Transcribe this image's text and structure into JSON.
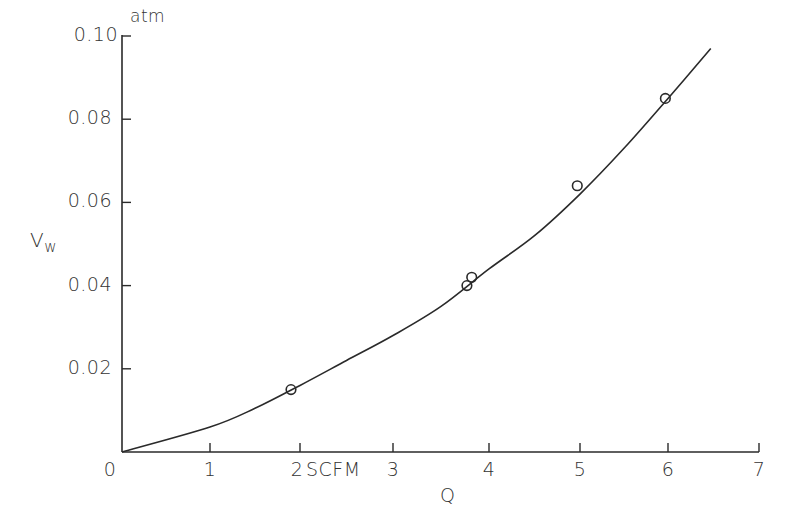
{
  "chart_data": {
    "type": "scatter",
    "title": "",
    "xlabel": "Q",
    "x_unit": "SCFM",
    "ylabel": "Vw",
    "y_unit": "atm",
    "xlim": [
      0,
      7
    ],
    "ylim": [
      0,
      0.1
    ],
    "grid": false,
    "x_ticks": [
      "0",
      "1",
      "2",
      "3",
      "4",
      "5",
      "6",
      "7"
    ],
    "y_ticks": [
      "0.02",
      "0.04",
      "0.06",
      "0.08",
      "0.10"
    ],
    "series": [
      {
        "name": "measured",
        "marker": "open-circle",
        "points": [
          {
            "x": 1.9,
            "y": 0.015
          },
          {
            "x": 3.77,
            "y": 0.04
          },
          {
            "x": 3.82,
            "y": 0.042
          },
          {
            "x": 4.97,
            "y": 0.064
          },
          {
            "x": 5.97,
            "y": 0.085
          }
        ]
      },
      {
        "name": "fit-curve",
        "style": "line",
        "points": [
          {
            "x": 0,
            "y": 0
          },
          {
            "x": 1,
            "y": 0.006
          },
          {
            "x": 1.5,
            "y": 0.0105
          },
          {
            "x": 2,
            "y": 0.016
          },
          {
            "x": 2.5,
            "y": 0.022
          },
          {
            "x": 3,
            "y": 0.028
          },
          {
            "x": 3.5,
            "y": 0.035
          },
          {
            "x": 4,
            "y": 0.044
          },
          {
            "x": 4.5,
            "y": 0.052
          },
          {
            "x": 5,
            "y": 0.062
          },
          {
            "x": 5.5,
            "y": 0.073
          },
          {
            "x": 6,
            "y": 0.085
          },
          {
            "x": 6.47,
            "y": 0.097
          }
        ]
      }
    ]
  },
  "labels": {
    "y_top": "0.10",
    "y_unit": "atm",
    "y_axis": "V",
    "y_axis_sub": "w",
    "x_axis": "Q",
    "x_unit_inline": "SCFM",
    "x_zero": "0"
  }
}
